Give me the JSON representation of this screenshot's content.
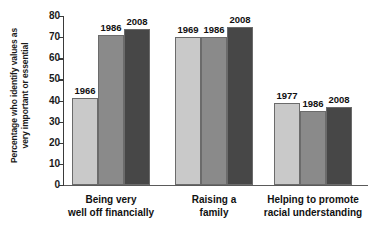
{
  "chart_data": {
    "type": "bar",
    "title": "",
    "xlabel": "",
    "ylabel": "Percentage who identify values as very important or essential",
    "ylabel_line1": "Percentage who identify values as",
    "ylabel_line2": "very important or essential",
    "ylim": [
      0,
      80
    ],
    "ytick_values": [
      0,
      10,
      20,
      30,
      40,
      50,
      60,
      70,
      80
    ],
    "ytick_labels": [
      "0",
      "10",
      "20",
      "30",
      "40",
      "50",
      "60",
      "70",
      "80"
    ],
    "grid": false,
    "legend": "none",
    "categories": [
      "Being very well off financially",
      "Raising a family",
      "Helping to promote racial understanding"
    ],
    "category_lines": [
      [
        "Being very",
        "well off financially"
      ],
      [
        "Raising a",
        "family"
      ],
      [
        "Helping to promote",
        "racial understanding"
      ]
    ],
    "groups": [
      {
        "category": "Being very well off financially",
        "bars": [
          {
            "label": "1966",
            "value": 41,
            "color": "#c9c9c9"
          },
          {
            "label": "1986",
            "value": 71,
            "color": "#8a8a8a"
          },
          {
            "label": "2008",
            "value": 74,
            "color": "#474747"
          }
        ]
      },
      {
        "category": "Raising a family",
        "bars": [
          {
            "label": "1969",
            "value": 70,
            "color": "#c9c9c9"
          },
          {
            "label": "1986",
            "value": 70,
            "color": "#8a8a8a"
          },
          {
            "label": "2008",
            "value": 75,
            "color": "#474747"
          }
        ]
      },
      {
        "category": "Helping to promote racial understanding",
        "bars": [
          {
            "label": "1977",
            "value": 39,
            "color": "#c9c9c9"
          },
          {
            "label": "1986",
            "value": 35,
            "color": "#8a8a8a"
          },
          {
            "label": "2008",
            "value": 37,
            "color": "#474747"
          }
        ]
      }
    ],
    "series_colors": {
      "light_gray": "#c9c9c9",
      "medium_gray": "#8a8a8a",
      "dark_gray": "#474747"
    },
    "axis_color": "#3a3a3a",
    "background": "#ffffff"
  }
}
